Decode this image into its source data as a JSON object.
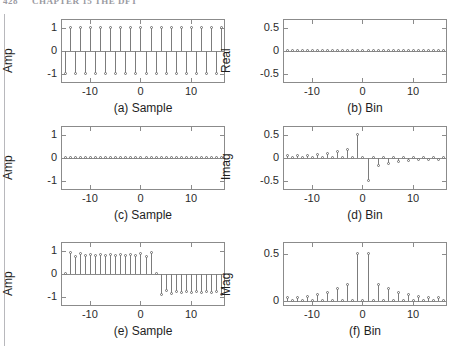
{
  "header": {
    "page_number": "428",
    "running_title": "CHAPTER 15  THE DFT"
  },
  "figure": {
    "panel_count": 6,
    "marker_style": "open-circle",
    "line_color": "#7c7c7c",
    "axis_color": "#8b8b8b",
    "text_color": "#1e1e1e"
  },
  "chart_data": [
    {
      "id": "a",
      "type": "scatter",
      "plot_style": "stem",
      "title": "(a) Sample",
      "xlabel": "Sample",
      "ylabel": "Amp",
      "xlim": [
        -15.5,
        16.5
      ],
      "ylim": [
        -1.35,
        1.35
      ],
      "xticks": [
        -10,
        0,
        10
      ],
      "xticklabels": [
        "-10",
        "0",
        "10"
      ],
      "yticks": [
        -1,
        0,
        1
      ],
      "yticklabels": [
        "-1",
        "0",
        "1"
      ],
      "grid": false,
      "x": [
        -15,
        -14,
        -13,
        -12,
        -11,
        -10,
        -9,
        -8,
        -7,
        -6,
        -5,
        -4,
        -3,
        -2,
        -1,
        0,
        1,
        2,
        3,
        4,
        5,
        6,
        7,
        8,
        9,
        10,
        11,
        12,
        13,
        14,
        15,
        16
      ],
      "values": [
        -1,
        1,
        -1,
        1,
        -1,
        1,
        -1,
        1,
        -1,
        1,
        -1,
        1,
        -1,
        1,
        -1,
        1,
        -1,
        1,
        -1,
        1,
        -1,
        1,
        -1,
        1,
        -1,
        1,
        -1,
        1,
        -1,
        1,
        -1,
        1
      ]
    },
    {
      "id": "b",
      "type": "scatter",
      "plot_style": "stem",
      "title": "(b) Bin",
      "xlabel": "Bin",
      "ylabel": "Real",
      "xlim": [
        -15.5,
        16.5
      ],
      "ylim": [
        -0.68,
        0.68
      ],
      "xticks": [
        -10,
        0,
        10
      ],
      "xticklabels": [
        "-10",
        "0",
        "10"
      ],
      "yticks": [
        -0.5,
        0,
        0.5
      ],
      "yticklabels": [
        "-0.5",
        "0",
        "0.5"
      ],
      "grid": false,
      "x": [
        -15,
        -14,
        -13,
        -12,
        -11,
        -10,
        -9,
        -8,
        -7,
        -6,
        -5,
        -4,
        -3,
        -2,
        -1,
        0,
        1,
        2,
        3,
        4,
        5,
        6,
        7,
        8,
        9,
        10,
        11,
        12,
        13,
        14,
        15,
        16
      ],
      "values": [
        0,
        0,
        0,
        0,
        0,
        0,
        0,
        0,
        0,
        0,
        0,
        0,
        0,
        0,
        0,
        0,
        0,
        0,
        0,
        0,
        0,
        0,
        0,
        0,
        0,
        0,
        0,
        0,
        0,
        0,
        0,
        0
      ]
    },
    {
      "id": "c",
      "type": "scatter",
      "plot_style": "stem",
      "title": "(c) Sample",
      "xlabel": "Sample",
      "ylabel": "Amp",
      "xlim": [
        -15.5,
        16.5
      ],
      "ylim": [
        -1.35,
        1.35
      ],
      "xticks": [
        -10,
        0,
        10
      ],
      "xticklabels": [
        "-10",
        "0",
        "10"
      ],
      "yticks": [
        -1,
        0,
        1
      ],
      "yticklabels": [
        "-1",
        "0",
        "1"
      ],
      "grid": false,
      "x": [
        -15,
        -14,
        -13,
        -12,
        -11,
        -10,
        -9,
        -8,
        -7,
        -6,
        -5,
        -4,
        -3,
        -2,
        -1,
        0,
        1,
        2,
        3,
        4,
        5,
        6,
        7,
        8,
        9,
        10,
        11,
        12,
        13,
        14,
        15,
        16
      ],
      "values": [
        0,
        0,
        0,
        0,
        0,
        0,
        0,
        0,
        0,
        0,
        0,
        0,
        0,
        0,
        0,
        0,
        0,
        0,
        0,
        0,
        0,
        0,
        0,
        0,
        0,
        0,
        0,
        0,
        0,
        0,
        0,
        0
      ]
    },
    {
      "id": "d",
      "type": "scatter",
      "plot_style": "stem",
      "title": "(d) Bin",
      "xlabel": "Bin",
      "ylabel": "Imag",
      "xlim": [
        -15.5,
        16.5
      ],
      "ylim": [
        -0.68,
        0.68
      ],
      "xticks": [
        -10,
        0,
        10
      ],
      "xticklabels": [
        "-10",
        "0",
        "10"
      ],
      "yticks": [
        -0.5,
        0,
        0.5
      ],
      "yticklabels": [
        "-0.5",
        "0",
        "0.5"
      ],
      "grid": false,
      "x": [
        -15,
        -14,
        -13,
        -12,
        -11,
        -10,
        -9,
        -8,
        -7,
        -6,
        -5,
        -4,
        -3,
        -2,
        -1,
        0,
        1,
        2,
        3,
        4,
        5,
        6,
        7,
        8,
        9,
        10,
        11,
        12,
        13,
        14,
        15,
        16
      ],
      "values": [
        0.033,
        0,
        0.039,
        0,
        0.048,
        0,
        0.062,
        0,
        0.085,
        0,
        0.13,
        0,
        0.175,
        0,
        0.5,
        0,
        -0.5,
        0,
        -0.175,
        0,
        -0.13,
        0,
        -0.085,
        0,
        -0.062,
        0,
        -0.048,
        0,
        -0.039,
        0,
        -0.033,
        0
      ]
    },
    {
      "id": "e",
      "type": "scatter",
      "plot_style": "stem",
      "title": "(e) Sample",
      "xlabel": "Sample",
      "ylabel": "Amp",
      "xlim": [
        -15.5,
        16.5
      ],
      "ylim": [
        -1.35,
        1.35
      ],
      "xticks": [
        -10,
        0,
        10
      ],
      "xticklabels": [
        "-10",
        "0",
        "10"
      ],
      "yticks": [
        -1,
        0,
        1
      ],
      "yticklabels": [
        "-1",
        "0",
        "1"
      ],
      "grid": false,
      "x": [
        -15,
        -14,
        -13,
        -12,
        -11,
        -10,
        -9,
        -8,
        -7,
        -6,
        -5,
        -4,
        -3,
        -2,
        -1,
        0,
        1,
        2,
        3,
        4,
        5,
        6,
        7,
        8,
        9,
        10,
        11,
        12,
        13,
        14,
        15,
        16
      ],
      "values": [
        0,
        0.93,
        0.72,
        0.85,
        0.79,
        0.82,
        0.8,
        0.81,
        0.8,
        0.81,
        0.8,
        0.81,
        0.8,
        0.82,
        0.79,
        0.85,
        0.72,
        0.93,
        0,
        -0.93,
        -0.72,
        -0.85,
        -0.79,
        -0.82,
        -0.8,
        -0.81,
        -0.8,
        -0.81,
        -0.8,
        -0.82,
        -0.79,
        -0.93
      ]
    },
    {
      "id": "f",
      "type": "scatter",
      "plot_style": "stem",
      "title": "(f) Bin",
      "xlabel": "Bin",
      "ylabel": "Mag",
      "xlim": [
        -15.5,
        16.5
      ],
      "ylim": [
        -0.04,
        0.62
      ],
      "xticks": [
        -10,
        0,
        10
      ],
      "xticklabels": [
        "-10",
        "0",
        "10"
      ],
      "yticks": [
        0,
        0.5
      ],
      "yticklabels": [
        "0",
        "0.5"
      ],
      "grid": false,
      "x": [
        -15,
        -14,
        -13,
        -12,
        -11,
        -10,
        -9,
        -8,
        -7,
        -6,
        -5,
        -4,
        -3,
        -2,
        -1,
        0,
        1,
        2,
        3,
        4,
        5,
        6,
        7,
        8,
        9,
        10,
        11,
        12,
        13,
        14,
        15,
        16
      ],
      "values": [
        0.033,
        0,
        0.039,
        0,
        0.048,
        0,
        0.062,
        0,
        0.085,
        0,
        0.13,
        0,
        0.175,
        0,
        0.5,
        0,
        0.5,
        0,
        0.175,
        0,
        0.13,
        0,
        0.085,
        0,
        0.062,
        0,
        0.048,
        0,
        0.039,
        0,
        0.033,
        0
      ]
    }
  ]
}
